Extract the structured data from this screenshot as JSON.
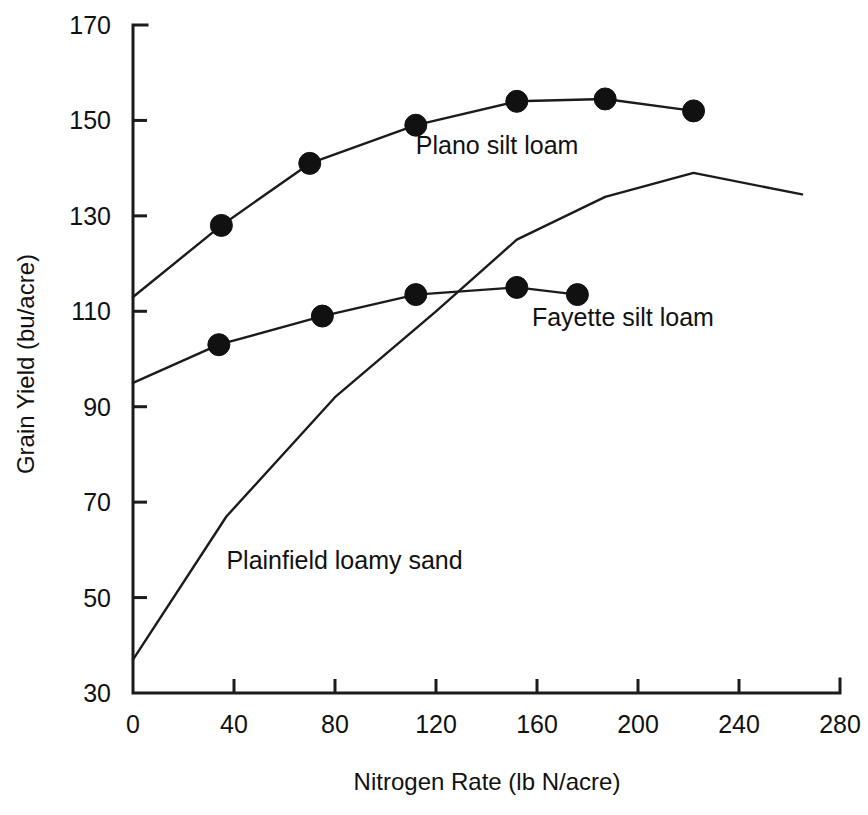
{
  "chart_data": {
    "type": "line",
    "title": "",
    "xlabel": "Nitrogen Rate (lb N/acre)",
    "ylabel": "Grain Yield (bu/acre)",
    "xlim": [
      0,
      280
    ],
    "ylim": [
      30,
      170
    ],
    "xticks": [
      0,
      40,
      80,
      120,
      160,
      200,
      240,
      280
    ],
    "yticks": [
      30,
      50,
      70,
      90,
      110,
      130,
      150,
      170
    ],
    "xtick_labels": [
      "0",
      "40",
      "80",
      "120",
      "160",
      "200",
      "240",
      "280"
    ],
    "ytick_labels": [
      "30",
      "50",
      "70",
      "90",
      "110",
      "130",
      "150",
      "170"
    ],
    "grid": false,
    "legend": "inline-annotations",
    "series": [
      {
        "name": "Plano silt loam",
        "markers": "filled-circle",
        "label_position": {
          "x": 112,
          "y": 143
        },
        "points": [
          {
            "x": 0,
            "y": 113,
            "marker": false
          },
          {
            "x": 35,
            "y": 128,
            "marker": true
          },
          {
            "x": 70,
            "y": 141,
            "marker": true
          },
          {
            "x": 112,
            "y": 149,
            "marker": true
          },
          {
            "x": 152,
            "y": 154,
            "marker": true
          },
          {
            "x": 187,
            "y": 154.5,
            "marker": true
          },
          {
            "x": 222,
            "y": 152,
            "marker": true
          }
        ]
      },
      {
        "name": "Fayette silt loam",
        "markers": "filled-circle",
        "label_position": {
          "x": 158,
          "y": 107
        },
        "points": [
          {
            "x": 0,
            "y": 95,
            "marker": false
          },
          {
            "x": 34,
            "y": 103,
            "marker": true
          },
          {
            "x": 75,
            "y": 109,
            "marker": true
          },
          {
            "x": 112,
            "y": 113.5,
            "marker": true
          },
          {
            "x": 152,
            "y": 115,
            "marker": true
          },
          {
            "x": 176,
            "y": 113.5,
            "marker": true
          }
        ]
      },
      {
        "name": "Plainfield loamy sand",
        "markers": "none",
        "label_position": {
          "x": 37,
          "y": 56
        },
        "points": [
          {
            "x": 0,
            "y": 37,
            "marker": false
          },
          {
            "x": 37,
            "y": 67,
            "marker": false
          },
          {
            "x": 80,
            "y": 92,
            "marker": false
          },
          {
            "x": 120,
            "y": 110,
            "marker": false
          },
          {
            "x": 152,
            "y": 125,
            "marker": false
          },
          {
            "x": 187,
            "y": 134,
            "marker": false
          },
          {
            "x": 222,
            "y": 139,
            "marker": false
          },
          {
            "x": 265,
            "y": 134.5,
            "marker": false
          }
        ]
      }
    ]
  },
  "figure": {
    "background_color": "#ffffff",
    "line_color": "#1b1b1b",
    "marker_color": "#111111",
    "text_color": "#111111"
  }
}
